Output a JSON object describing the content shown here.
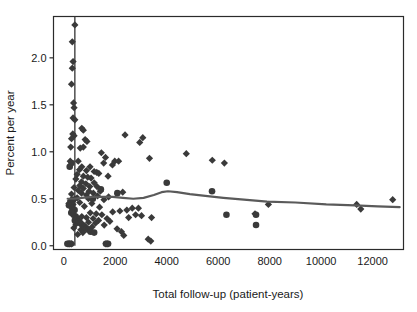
{
  "chart_data": {
    "type": "scatter",
    "title": "",
    "xlabel": "Total follow-up (patient-years)",
    "ylabel": "Percent per year",
    "xlim": [
      -400,
      13200
    ],
    "ylim": [
      -0.04,
      2.44
    ],
    "xticks": [
      0,
      2000,
      4000,
      6000,
      8000,
      10000,
      12000
    ],
    "xtick_labels": [
      "0",
      "2000",
      "4000",
      "6000",
      "8000",
      "10000",
      "12000"
    ],
    "yticks": [
      0.0,
      0.5,
      1.0,
      1.5,
      2.0
    ],
    "ytick_labels": [
      "0.0",
      "0.5",
      "1.0",
      "1.5",
      "2.0"
    ],
    "grid": false,
    "legend": null,
    "marker_color": "#3a3a3a",
    "line_color": "#5a5a5a",
    "frame_color": "#2b2b2b",
    "reference_line": {
      "orientation": "vertical",
      "x": 430,
      "y_from": 0.0,
      "y_to": 2.44,
      "color": "#333333"
    },
    "series": [
      {
        "name": "diamonds",
        "marker": "diamond",
        "points": [
          [
            430,
            2.35
          ],
          [
            330,
            2.17
          ],
          [
            360,
            1.96
          ],
          [
            330,
            1.89
          ],
          [
            300,
            1.72
          ],
          [
            380,
            1.52
          ],
          [
            400,
            1.47
          ],
          [
            360,
            1.36
          ],
          [
            430,
            1.34
          ],
          [
            700,
            1.25
          ],
          [
            760,
            1.23
          ],
          [
            350,
            1.19
          ],
          [
            400,
            1.17
          ],
          [
            300,
            1.14
          ],
          [
            830,
            1.13
          ],
          [
            900,
            1.11
          ],
          [
            2380,
            1.18
          ],
          [
            3070,
            1.15
          ],
          [
            2950,
            1.1
          ],
          [
            760,
            1.05
          ],
          [
            270,
            1.05
          ],
          [
            640,
            1.04
          ],
          [
            1460,
            0.99
          ],
          [
            4760,
            0.98
          ],
          [
            1620,
            0.94
          ],
          [
            3330,
            0.93
          ],
          [
            5770,
            0.91
          ],
          [
            1980,
            0.9
          ],
          [
            2130,
            0.9
          ],
          [
            6240,
            0.88
          ],
          [
            560,
            0.9
          ],
          [
            250,
            0.9
          ],
          [
            1550,
            0.88
          ],
          [
            1890,
            0.86
          ],
          [
            700,
            0.84
          ],
          [
            1020,
            0.84
          ],
          [
            610,
            0.81
          ],
          [
            880,
            0.8
          ],
          [
            1180,
            0.79
          ],
          [
            1280,
            0.78
          ],
          [
            1360,
            0.77
          ],
          [
            520,
            0.76
          ],
          [
            760,
            0.74
          ],
          [
            1720,
            0.74
          ],
          [
            930,
            0.73
          ],
          [
            1060,
            0.72
          ],
          [
            470,
            0.71
          ],
          [
            690,
            0.68
          ],
          [
            1180,
            0.67
          ],
          [
            860,
            0.66
          ],
          [
            620,
            0.64
          ],
          [
            1010,
            0.63
          ],
          [
            1290,
            0.63
          ],
          [
            400,
            0.62
          ],
          [
            760,
            0.61
          ],
          [
            560,
            0.59
          ],
          [
            980,
            0.58
          ],
          [
            1420,
            0.58
          ],
          [
            2290,
            0.57
          ],
          [
            1150,
            0.56
          ],
          [
            690,
            0.56
          ],
          [
            300,
            0.55
          ],
          [
            880,
            0.54
          ],
          [
            1310,
            0.53
          ],
          [
            1740,
            0.52
          ],
          [
            520,
            0.51
          ],
          [
            430,
            0.5
          ],
          [
            960,
            0.5
          ],
          [
            1560,
            0.49
          ],
          [
            260,
            0.48
          ],
          [
            12780,
            0.49
          ],
          [
            11380,
            0.44
          ],
          [
            11540,
            0.39
          ],
          [
            7950,
            0.44
          ],
          [
            620,
            0.46
          ],
          [
            1090,
            0.45
          ],
          [
            360,
            0.44
          ],
          [
            800,
            0.42
          ],
          [
            1390,
            0.41
          ],
          [
            200,
            0.45
          ],
          [
            2660,
            0.4
          ],
          [
            2900,
            0.4
          ],
          [
            2450,
            0.38
          ],
          [
            2180,
            0.37
          ],
          [
            7430,
            0.34
          ],
          [
            1900,
            0.36
          ],
          [
            1030,
            0.35
          ],
          [
            1260,
            0.34
          ],
          [
            1480,
            0.33
          ],
          [
            2790,
            0.33
          ],
          [
            3020,
            0.32
          ],
          [
            3410,
            0.3
          ],
          [
            700,
            0.31
          ],
          [
            880,
            0.3
          ],
          [
            1140,
            0.29
          ],
          [
            1680,
            0.29
          ],
          [
            2520,
            0.3
          ],
          [
            560,
            0.27
          ],
          [
            1350,
            0.27
          ],
          [
            1790,
            0.26
          ],
          [
            960,
            0.25
          ],
          [
            1230,
            0.24
          ],
          [
            470,
            0.23
          ],
          [
            1570,
            0.22
          ],
          [
            820,
            0.21
          ],
          [
            1100,
            0.2
          ],
          [
            390,
            0.19
          ],
          [
            660,
            0.17
          ],
          [
            2070,
            0.18
          ],
          [
            2240,
            0.15
          ],
          [
            740,
            0.14
          ],
          [
            540,
            0.12
          ],
          [
            2330,
            0.11
          ],
          [
            3280,
            0.07
          ],
          [
            3380,
            0.05
          ],
          [
            1640,
            0.02
          ],
          [
            1710,
            0.02
          ],
          [
            230,
            0.02
          ],
          [
            300,
            0.02
          ],
          [
            170,
            0.02
          ]
        ]
      },
      {
        "name": "circles",
        "marker": "circle",
        "points": [
          [
            300,
            0.88
          ],
          [
            230,
            0.84
          ],
          [
            4000,
            0.67
          ],
          [
            5760,
            0.58
          ],
          [
            360,
            0.49
          ],
          [
            300,
            0.47
          ],
          [
            250,
            0.45
          ],
          [
            200,
            0.43
          ],
          [
            330,
            0.4
          ],
          [
            420,
            0.38
          ],
          [
            290,
            0.35
          ],
          [
            380,
            0.33
          ],
          [
            6320,
            0.33
          ],
          [
            7470,
            0.33
          ],
          [
            460,
            0.31
          ],
          [
            520,
            0.29
          ],
          [
            430,
            0.27
          ],
          [
            590,
            0.26
          ],
          [
            650,
            0.24
          ],
          [
            7470,
            0.22
          ],
          [
            720,
            0.22
          ],
          [
            800,
            0.2
          ],
          [
            880,
            0.18
          ],
          [
            960,
            0.17
          ],
          [
            1040,
            0.15
          ],
          [
            1180,
            0.14
          ],
          [
            1640,
            0.02
          ],
          [
            1720,
            0.02
          ],
          [
            140,
            0.02
          ],
          [
            210,
            0.02
          ],
          [
            280,
            0.02
          ],
          [
            2080,
            0.56
          ],
          [
            1440,
            0.6
          ],
          [
            1130,
            0.5
          ]
        ]
      }
    ],
    "trend_line": {
      "name": "smoothed fit",
      "points": [
        [
          150,
          0.5
        ],
        [
          400,
          0.5
        ],
        [
          700,
          0.51
        ],
        [
          1100,
          0.52
        ],
        [
          1500,
          0.52
        ],
        [
          1900,
          0.52
        ],
        [
          2300,
          0.51
        ],
        [
          2700,
          0.5
        ],
        [
          3100,
          0.51
        ],
        [
          3500,
          0.54
        ],
        [
          3800,
          0.57
        ],
        [
          4050,
          0.58
        ],
        [
          4400,
          0.57
        ],
        [
          4900,
          0.55
        ],
        [
          5500,
          0.53
        ],
        [
          6200,
          0.51
        ],
        [
          7000,
          0.49
        ],
        [
          7900,
          0.47
        ],
        [
          9000,
          0.46
        ],
        [
          10200,
          0.44
        ],
        [
          11300,
          0.43
        ],
        [
          12200,
          0.42
        ],
        [
          13050,
          0.41
        ]
      ]
    }
  }
}
